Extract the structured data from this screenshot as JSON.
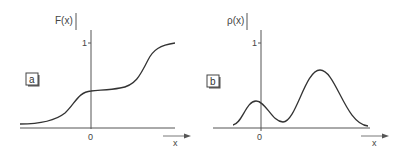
{
  "panels": [
    {
      "id": "a",
      "label": "a",
      "ylabel": "F(x)",
      "ytick": "1",
      "xtick": "0",
      "xlabel": "x",
      "description": "Cumulative distribution function with two steps"
    },
    {
      "id": "b",
      "label": "b",
      "ylabel": "ρ(x)",
      "ytick": "1",
      "xtick": "0",
      "xlabel": "x",
      "description": "Bimodal probability density with small peak near 0 and larger peak to the right"
    }
  ],
  "colors": {
    "line": "#333333",
    "axis": "#555555",
    "background": "#ffffff"
  }
}
